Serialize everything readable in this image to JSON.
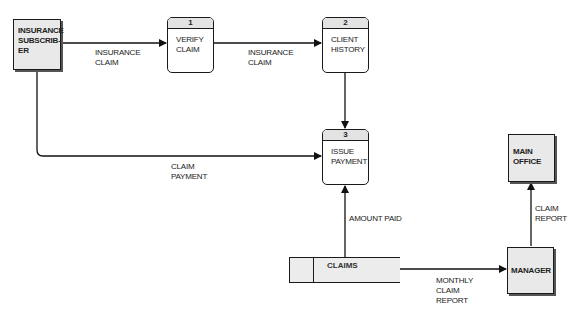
{
  "entities": [
    {
      "id": "insurance-subscriber",
      "label": "INSURANCE SUBSCRIB- ER"
    },
    {
      "id": "main-office",
      "label": "MAIN OFFICE"
    },
    {
      "id": "manager",
      "label": "MANAGER"
    }
  ],
  "processes": [
    {
      "number": "1",
      "label": "VERIFY CLAIM"
    },
    {
      "number": "2",
      "label": "CLIENT HISTORY"
    },
    {
      "number": "3",
      "label": "ISSUE PAYMENT"
    }
  ],
  "data_stores": [
    {
      "label": "CLAIMS"
    }
  ],
  "flows": [
    {
      "from": "insurance-subscriber",
      "to": "process-1",
      "label": "INSURANCE\nCLAIM"
    },
    {
      "from": "process-1",
      "to": "process-2",
      "label": "INSURANCE\nCLAIM"
    },
    {
      "from": "process-2",
      "to": "process-3",
      "label": ""
    },
    {
      "from": "insurance-subscriber",
      "to": "process-3",
      "label": "CLAIM\nPAYMENT"
    },
    {
      "from": "claims-store",
      "to": "process-3",
      "label": "AMOUNT PAID"
    },
    {
      "from": "claims-store",
      "to": "manager",
      "label": "MONTHLY\nCLAIM\nREPORT"
    },
    {
      "from": "manager",
      "to": "main-office",
      "label": "CLAIM\nREPORT"
    }
  ]
}
